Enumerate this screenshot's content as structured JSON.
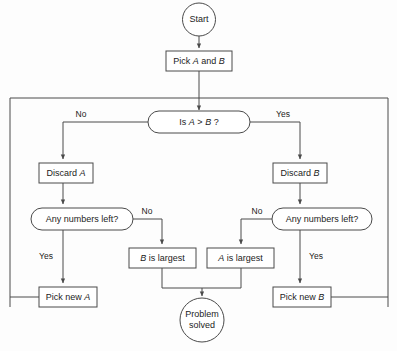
{
  "diagram": {
    "background_color": "#fdfdfd",
    "line_color": "#4a4a4a",
    "text_color": "#1c1c1c"
  },
  "nodes": {
    "start": {
      "label": "Start",
      "shape": "circle"
    },
    "pick_a_and_b": {
      "label_pre": "Pick ",
      "label_a": "A",
      "label_mid": " and ",
      "label_b": "B",
      "shape": "rectangle"
    },
    "is_a_gt_b": {
      "label_pre": "Is ",
      "label_a": "A",
      "label_op": " > ",
      "label_b": "B",
      "label_post": " ?",
      "shape": "stadium"
    },
    "discard_a": {
      "label_pre": "Discard ",
      "label_var": "A",
      "shape": "rectangle"
    },
    "discard_b": {
      "label_pre": "Discard ",
      "label_var": "B",
      "shape": "rectangle"
    },
    "any_numbers_left_left": {
      "label": "Any numbers left?",
      "shape": "stadium"
    },
    "any_numbers_left_right": {
      "label": "Any numbers left?",
      "shape": "stadium"
    },
    "b_is_largest": {
      "label_var": "B",
      "label_post": " is largest",
      "shape": "rectangle"
    },
    "a_is_largest": {
      "label_var": "A",
      "label_post": " is largest",
      "shape": "rectangle"
    },
    "pick_new_a": {
      "label_pre": "Pick new ",
      "label_var": "A",
      "shape": "rectangle"
    },
    "pick_new_b": {
      "label_pre": "Pick new ",
      "label_var": "B",
      "shape": "rectangle"
    },
    "problem_solved": {
      "label_line1": "Problem",
      "label_line2": "solved",
      "shape": "circle"
    }
  },
  "edge_labels": {
    "decision_no": "No",
    "decision_yes": "Yes",
    "left_any_no": "No",
    "left_any_yes": "Yes",
    "right_any_no": "No",
    "right_any_yes": "Yes"
  }
}
